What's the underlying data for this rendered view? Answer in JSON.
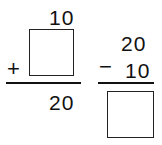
{
  "problems": [
    {
      "operation": "addition",
      "top": "10",
      "operator": "+",
      "bottom": "",
      "result": "20",
      "blank": "bottom"
    },
    {
      "operation": "subtraction",
      "top": "20",
      "operator": "−",
      "bottom": "10",
      "result": "",
      "blank": "result"
    }
  ]
}
